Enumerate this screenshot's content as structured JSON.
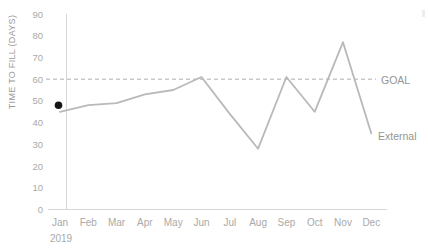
{
  "page": {
    "background": "#ffffff"
  },
  "chart_data": {
    "type": "line",
    "title": "",
    "xlabel": "",
    "ylabel": "TIME TO FILL (DAYS)",
    "year_label": "2019",
    "categories": [
      "Jan",
      "Feb",
      "Mar",
      "Apr",
      "May",
      "Jun",
      "Jul",
      "Aug",
      "Sep",
      "Oct",
      "Nov",
      "Dec"
    ],
    "y_ticks": [
      90,
      80,
      70,
      60,
      50,
      40,
      30,
      20,
      10,
      0
    ],
    "ylim": [
      0,
      90
    ],
    "grid": false,
    "legend_position": "inline-right",
    "series": [
      {
        "name": "External",
        "values": [
          45,
          48,
          49,
          53,
          55,
          61,
          44,
          28,
          61,
          45,
          77,
          35
        ],
        "color": "#b9b9b9"
      }
    ],
    "reference_line": {
      "label": "GOAL",
      "value": 60,
      "style": "dashed",
      "color": "#adadad"
    },
    "start_marker": {
      "category": "Jan",
      "value": 48,
      "color": "#161616"
    }
  },
  "colors": {
    "axis_line": "#d7d7d7",
    "tick_label": "#a9a9a9",
    "axis_title": "#999999",
    "annotation": "#959595"
  }
}
